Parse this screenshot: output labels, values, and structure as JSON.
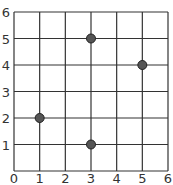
{
  "chart_data": {
    "type": "scatter",
    "title": "",
    "xlabel": "",
    "ylabel": "",
    "xlim": [
      0,
      6
    ],
    "ylim": [
      0,
      6
    ],
    "grid": true,
    "x_ticks": [
      "0",
      "1",
      "2",
      "3",
      "4",
      "5",
      "6"
    ],
    "y_ticks": [
      "1",
      "2",
      "3",
      "4",
      "5",
      "6"
    ],
    "points": [
      {
        "x": 1,
        "y": 2
      },
      {
        "x": 3,
        "y": 5
      },
      {
        "x": 3,
        "y": 1
      },
      {
        "x": 5,
        "y": 4
      }
    ],
    "colors": {
      "grid": "#333333",
      "point": "#555555",
      "point_edge": "#222222"
    }
  }
}
